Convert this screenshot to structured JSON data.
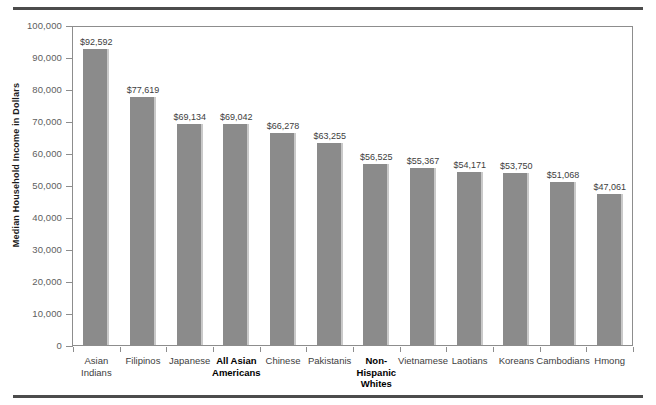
{
  "chart_data": {
    "type": "bar",
    "title": "",
    "xlabel": "",
    "ylabel": "Median Household Income in Dollars",
    "ylim": [
      0,
      100000
    ],
    "ytick_values": [
      0,
      10000,
      20000,
      30000,
      40000,
      50000,
      60000,
      70000,
      80000,
      90000,
      100000
    ],
    "ytick_labels": [
      "0",
      "10,000",
      "20,000",
      "30,000",
      "40,000",
      "50,000",
      "60,000",
      "70,000",
      "80,000",
      "90,000",
      "100,000"
    ],
    "grid": false,
    "legend": null,
    "bar_color": "#8b8b8b",
    "categories": [
      "Asian Indians",
      "Filipinos",
      "Japanese",
      "All Asian Americans",
      "Chinese",
      "Pakistanis",
      "Non-Hispanic Whites",
      "Vietnamese",
      "Laotians",
      "Koreans",
      "Cambodians",
      "Hmong"
    ],
    "values": [
      92592,
      77619,
      69134,
      69042,
      66278,
      63255,
      56525,
      55367,
      54171,
      53750,
      51068,
      47061
    ],
    "value_labels": [
      "$92,592",
      "$77,619",
      "$69,134",
      "$69,042",
      "$66,278",
      "$63,255",
      "$56,525",
      "$55,367",
      "$54,171",
      "$53,750",
      "$51,068",
      "$47,061"
    ],
    "category_label_lines": [
      [
        "Asian",
        "Indians"
      ],
      [
        "Filipinos"
      ],
      [
        "Japanese"
      ],
      [
        "All Asian",
        "Americans"
      ],
      [
        "Chinese"
      ],
      [
        "Pakistanis"
      ],
      [
        "Non-",
        "Hispanic",
        "Whites"
      ],
      [
        "Vietnamese"
      ],
      [
        "Laotians"
      ],
      [
        "Koreans"
      ],
      [
        "Cambodians"
      ],
      [
        "Hmong"
      ]
    ],
    "emphasized_categories": [
      "All Asian Americans",
      "Non-Hispanic Whites"
    ]
  }
}
